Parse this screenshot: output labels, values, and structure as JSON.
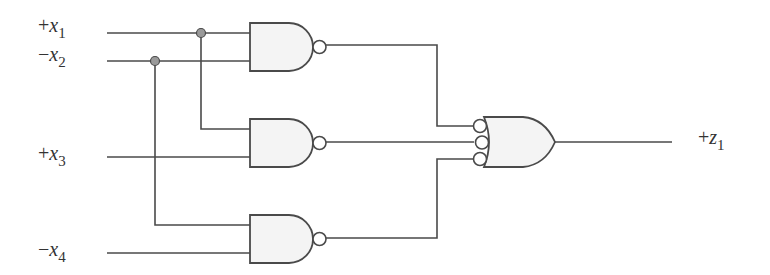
{
  "diagram": {
    "type": "logic-circuit",
    "inputs": [
      {
        "id": "x1",
        "sign": "+",
        "var": "x",
        "sub": "1"
      },
      {
        "id": "x2",
        "sign": "−",
        "var": "x",
        "sub": "2"
      },
      {
        "id": "x3",
        "sign": "+",
        "var": "x",
        "sub": "3"
      },
      {
        "id": "x4",
        "sign": "−",
        "var": "x",
        "sub": "4"
      }
    ],
    "output": {
      "id": "z1",
      "sign": "+",
      "var": "z",
      "sub": "1"
    },
    "gates": [
      {
        "id": "nand1",
        "type": "NAND",
        "inputs": [
          "x1",
          "x2"
        ]
      },
      {
        "id": "nand2",
        "type": "NAND",
        "inputs": [
          "x1",
          "x3"
        ]
      },
      {
        "id": "nand3",
        "type": "NAND",
        "inputs": [
          "x2",
          "x4"
        ]
      },
      {
        "id": "or1",
        "type": "OR (inverted inputs)",
        "inputs": [
          "nand1",
          "nand2",
          "nand3"
        ],
        "output": "z1"
      }
    ],
    "colors": {
      "line": "#4a4a4a",
      "gate_fill": "#f4f4f4",
      "junction_dot": "#9a9a9a"
    }
  }
}
